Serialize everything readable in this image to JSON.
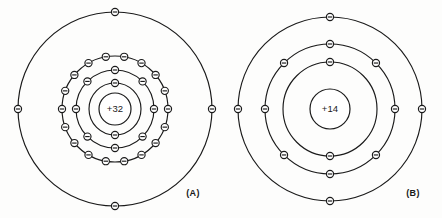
{
  "figure": {
    "background_color": "#fdfdfc",
    "line_color": "#1a1a1a",
    "width": 442,
    "height": 218
  },
  "diagrams": [
    {
      "id": "diagram-a",
      "caption": "(A)",
      "caption_x": 193,
      "caption_y": 196,
      "element_hint": "germanium",
      "nucleus_label": "+32",
      "nucleus_charge": 32,
      "center_x": 115,
      "center_y": 109,
      "nucleus_radius": 16,
      "electron_radius": 3.6,
      "shells": [
        {
          "name": "K",
          "index": 1,
          "radius": 26,
          "electron_count": 2,
          "start_angle": -90
        },
        {
          "name": "L",
          "index": 2,
          "radius": 39,
          "electron_count": 8,
          "start_angle": -90
        },
        {
          "name": "M",
          "index": 3,
          "radius": 53,
          "electron_count": 18,
          "start_angle": -80
        },
        {
          "name": "N",
          "index": 4,
          "radius": 97,
          "electron_count": 4,
          "start_angle": -90
        }
      ]
    },
    {
      "id": "diagram-b",
      "caption": "(B)",
      "caption_x": 413,
      "caption_y": 196,
      "element_hint": "silicon",
      "nucleus_label": "+14",
      "nucleus_charge": 14,
      "center_x": 330,
      "center_y": 109,
      "nucleus_radius": 20,
      "electron_radius": 3.6,
      "shells": [
        {
          "name": "K",
          "index": 1,
          "radius": 47,
          "electron_count": 2,
          "start_angle": -90
        },
        {
          "name": "L",
          "index": 2,
          "radius": 65,
          "electron_count": 8,
          "start_angle": -90
        },
        {
          "name": "M",
          "index": 3,
          "radius": 92,
          "electron_count": 4,
          "start_angle": -90
        }
      ]
    }
  ]
}
